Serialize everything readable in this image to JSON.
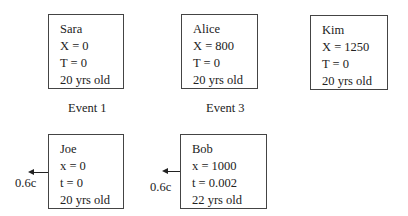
{
  "observers": {
    "sara": {
      "name": "Sara",
      "pos": "X = 0",
      "time": "T = 0",
      "age": "20 yrs old"
    },
    "alice": {
      "name": "Alice",
      "pos": "X = 800",
      "time": "T = 0",
      "age": "20 yrs old"
    },
    "kim": {
      "name": "Kim",
      "pos": "X = 1250",
      "time": "T = 0",
      "age": "20 yrs old"
    },
    "joe": {
      "name": "Joe",
      "pos": "x = 0",
      "time": "t = 0",
      "age": "20 yrs old",
      "velocity": "0.6c"
    },
    "bob": {
      "name": "Bob",
      "pos": "x = 1000",
      "time": "t = 0.002",
      "age": "22 yrs old",
      "velocity": "0.6c"
    }
  },
  "events": {
    "event1": "Event 1",
    "event3": "Event 3"
  }
}
